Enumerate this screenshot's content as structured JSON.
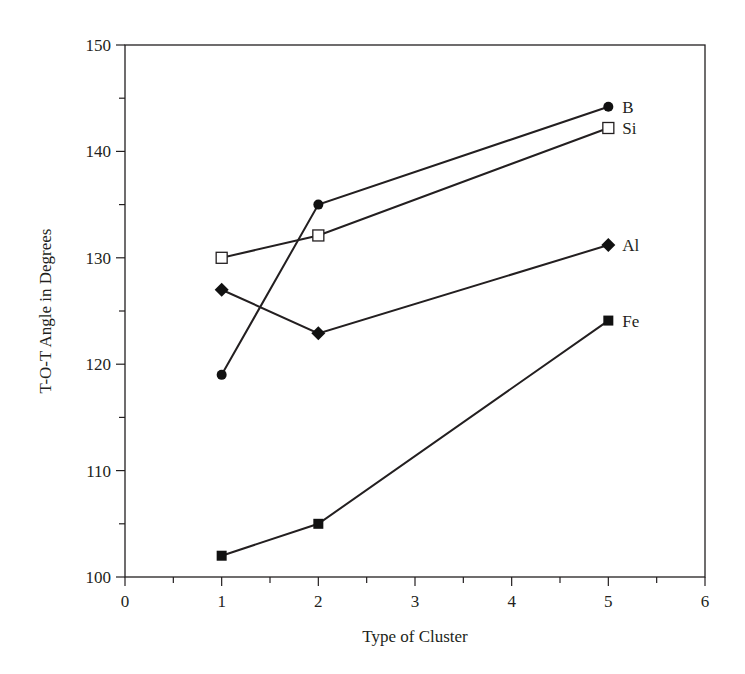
{
  "chart_data": {
    "type": "line",
    "title": "",
    "xlabel": "Type of Cluster",
    "ylabel": "T-O-T Angle in Degrees",
    "xlim": [
      0,
      6
    ],
    "ylim": [
      100,
      150
    ],
    "x_ticks": [
      0,
      1,
      2,
      3,
      4,
      5,
      6
    ],
    "x_minor_step": 0.5,
    "y_ticks": [
      100,
      110,
      120,
      130,
      140,
      150
    ],
    "y_minor_step": 5,
    "grid": false,
    "frame": "box",
    "legend": "inline labels at right end of each series",
    "series": [
      {
        "name": "B",
        "marker": "filled-circle",
        "x": [
          1,
          2,
          5
        ],
        "values": [
          119,
          135,
          144.2
        ]
      },
      {
        "name": "Si",
        "marker": "open-square",
        "x": [
          1,
          2,
          5
        ],
        "values": [
          130,
          132.1,
          142.2
        ]
      },
      {
        "name": "Al",
        "marker": "filled-diamond",
        "x": [
          1,
          2,
          5
        ],
        "values": [
          127,
          122.9,
          131.2
        ]
      },
      {
        "name": "Fe",
        "marker": "filled-square",
        "x": [
          1,
          2,
          5
        ],
        "values": [
          102,
          105,
          124.1
        ]
      }
    ],
    "colors": {
      "line": "#231f20",
      "marker_fill": "#111111",
      "open_marker_fill": "#ffffff"
    }
  }
}
